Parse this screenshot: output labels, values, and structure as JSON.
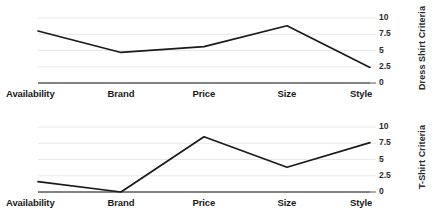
{
  "chart_data": [
    {
      "type": "line",
      "title": "",
      "ylabel": "Dress Shirt Criteria",
      "xlabel": "",
      "categories": [
        "Availability",
        "Brand",
        "Price",
        "Size",
        "Style"
      ],
      "values": [
        8.0,
        4.7,
        5.6,
        8.8,
        2.4
      ],
      "yticks": [
        "0",
        "2.5",
        "5",
        "7.5",
        "10"
      ],
      "ytick_values": [
        0,
        2.5,
        5,
        7.5,
        10
      ],
      "ylim": [
        0,
        10
      ],
      "grid": true,
      "legend": "none",
      "axis_position": "right",
      "line_color": "#1a1a1a",
      "grid_color": "#e8e8e8",
      "baseline_color": "#595959"
    },
    {
      "type": "line",
      "title": "",
      "ylabel": "T-Shirt Criteria",
      "xlabel": "",
      "categories": [
        "Availability",
        "Brand",
        "Price",
        "Size",
        "Style"
      ],
      "values": [
        1.6,
        0.0,
        8.5,
        3.8,
        7.6
      ],
      "yticks": [
        "0",
        "2.5",
        "5",
        "7.5",
        "10"
      ],
      "ytick_values": [
        0,
        2.5,
        5,
        7.5,
        10
      ],
      "ylim": [
        0,
        10
      ],
      "grid": true,
      "legend": "none",
      "axis_position": "right",
      "line_color": "#1a1a1a",
      "grid_color": "#e8e8e8",
      "baseline_color": "#595959"
    }
  ]
}
